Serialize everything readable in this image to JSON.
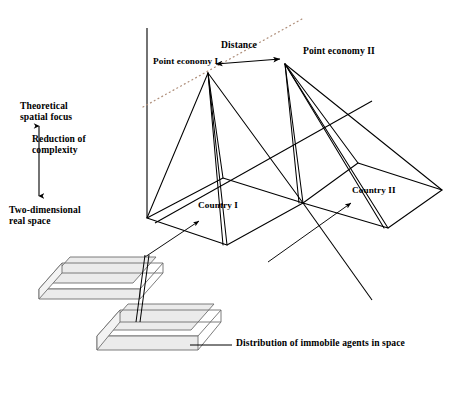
{
  "figure": {
    "type": "conceptual-3d-diagram",
    "background_color": "#ffffff",
    "stroke_color": "#000000",
    "slab_fill_color": "#ebebeb",
    "slab_edge_color": "#6e6e6e",
    "dotted_line_color": "#b0907c"
  },
  "labels": {
    "theoretical_spatial_focus": "Theoretical\nspatial focus",
    "reduction_of_complexity": "Reduction of\ncomplexity",
    "two_dimensional_real_space": "Two-dimensional\nreal space",
    "distance": "Distance",
    "point_economy_i": "Point economy I",
    "point_economy_ii": "Point economy II",
    "country_i": "Country I",
    "country_ii": "Country II",
    "distribution_of_immobile_agents": "Distribution of immobile agents in space"
  },
  "axis": {
    "vertical_axis_label_top": "Theoretical\nspatial focus",
    "vertical_axis_label_bottom": "Two-dimensional\nreal space",
    "vertical_axis_middle_label": "Reduction of\ncomplexity",
    "direction": "double-headed-vertical"
  },
  "geometry": {
    "apex_point_economy_i": [
      208,
      73
    ],
    "apex_point_economy_ii": [
      285,
      64
    ],
    "base_plane_left_corner": [
      147,
      218
    ],
    "base_plane_center_corner": [
      303,
      203
    ],
    "base_plane_right_corner": [
      442,
      190
    ],
    "base_plane_back_left": [
      223,
      178
    ],
    "base_plane_back_center": [
      358,
      163
    ],
    "base_plane_front_center": [
      227,
      245
    ],
    "base_plane_front_right": [
      388,
      228
    ],
    "vertical_axis_top": [
      147,
      28
    ],
    "vertical_axis_bottom": [
      147,
      218
    ]
  },
  "elements": {
    "cones": [
      {
        "name": "cone-point-economy-i",
        "apex_label": "Point economy I",
        "base_label": "Country I"
      },
      {
        "name": "cone-point-economy-ii",
        "apex_label": "Point economy II",
        "base_label": "Country II"
      }
    ],
    "slabs": [
      {
        "name": "slab-upper",
        "meaning": "Distribution of immobile agents in space"
      },
      {
        "name": "slab-lower",
        "meaning": "Distribution of immobile agents in space"
      }
    ],
    "arrows": [
      {
        "name": "distance-arrow",
        "style": "double-headed",
        "label": "Distance"
      },
      {
        "name": "pointer-country-i",
        "style": "single-headed"
      },
      {
        "name": "pointer-country-ii",
        "style": "single-headed"
      },
      {
        "name": "axis-arrow-reduction",
        "style": "double-headed"
      }
    ],
    "leader_lines": [
      {
        "name": "leader-distribution-of-immobile-agents"
      }
    ]
  }
}
